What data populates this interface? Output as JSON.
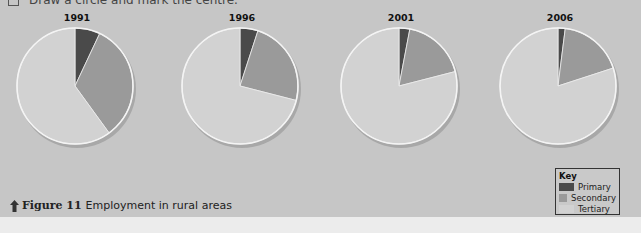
{
  "instruction": {
    "number": "2",
    "text": "Draw a circle and mark the centre."
  },
  "caption": {
    "figure": "Figure 11",
    "text": "Employment in rural areas"
  },
  "key": {
    "title": "Key",
    "items": [
      {
        "label": "Primary",
        "color": "#4a4a4a"
      },
      {
        "label": "Secondary",
        "color": "#9a9a9a"
      },
      {
        "label": "Tertiary",
        "color": "#d2d2d2"
      }
    ]
  },
  "pies": [
    {
      "year": "1991"
    },
    {
      "year": "1996"
    },
    {
      "year": "2001"
    },
    {
      "year": "2006"
    }
  ],
  "chart_data": {
    "type": "pie",
    "title": "Employment in rural areas",
    "categories": [
      "Primary",
      "Secondary",
      "Tertiary"
    ],
    "colors": [
      "#4a4a4a",
      "#9a9a9a",
      "#d2d2d2"
    ],
    "charts": [
      {
        "label": "1991",
        "values": [
          7,
          33,
          60
        ]
      },
      {
        "label": "1996",
        "values": [
          5,
          24,
          71
        ]
      },
      {
        "label": "2001",
        "values": [
          3,
          18,
          79
        ]
      },
      {
        "label": "2006",
        "values": [
          2,
          18,
          80
        ]
      }
    ],
    "unit": "%",
    "legend_position": "bottom-right",
    "legend_title": "Key"
  }
}
